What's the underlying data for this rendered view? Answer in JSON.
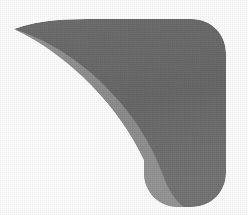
{
  "image": {
    "kind": "abstract-logo-graphic",
    "description": "Grayscale boomerang / swoosh mark with rounded-square right side",
    "width": 248,
    "height": 215,
    "background_color": "#fefefe"
  },
  "graphic": {
    "title": "swoosh-logo",
    "bands": [
      {
        "name": "outer-dark-band",
        "label": "Dark gray outer band",
        "color": "#6b6b6b"
      },
      {
        "name": "middle-gray-band",
        "label": "Medium gray middle band",
        "color": "#8e8e8e"
      },
      {
        "name": "inner-light-band",
        "label": "Light gray inner band",
        "color": "#b2b2b2"
      },
      {
        "name": "highlight-band",
        "label": "Pale highlight edge",
        "color": "#c9c9c9"
      }
    ],
    "geometry": {
      "tip_point": "14,29",
      "corner_radius": 34,
      "right_edge_x": 226,
      "top_edge_y": 19,
      "bottom_edge_y": 207
    }
  }
}
